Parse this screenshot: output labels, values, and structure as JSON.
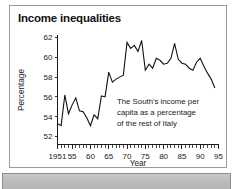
{
  "figure": {
    "title": "Income inequalities",
    "background_color": "#ffffff",
    "frame_color": "#9a9a9a",
    "line_color": "#111111",
    "bottom_band_color": "#c1c1c1"
  },
  "annotation": {
    "line1": "The South's income per",
    "line2": "capita as a percentage",
    "line3": "of the rest of Italy"
  },
  "chart_data": {
    "type": "line",
    "title": "Income inequalities",
    "xlabel": "Year",
    "ylabel": "Percentage",
    "xlim": [
      1951,
      1995
    ],
    "ylim": [
      51.2,
      62.3
    ],
    "ytick_values": [
      52,
      54,
      56,
      58,
      60,
      62
    ],
    "ytick_labels": [
      "52",
      "54",
      "56",
      "58",
      "60",
      "62"
    ],
    "xtick_values": [
      1951,
      1955,
      1960,
      1965,
      1970,
      1975,
      1980,
      1985,
      1990,
      1995
    ],
    "xtick_labels": [
      "1951",
      "55",
      "60",
      "65",
      "70",
      "75",
      "80",
      "85",
      "90",
      "95"
    ],
    "minor_xticks_every": 1,
    "grid": false,
    "legend": null,
    "annotation_text": "The South's income per capita as a percentage of the rest of Italy",
    "series": [
      {
        "name": "South's income per capita as % of rest of Italy",
        "color": "#111111",
        "x": [
          1951,
          1952,
          1953,
          1954,
          1955,
          1956,
          1957,
          1958,
          1959,
          1960,
          1961,
          1962,
          1963,
          1964,
          1965,
          1966,
          1967,
          1968,
          1969,
          1970,
          1971,
          1972,
          1973,
          1974,
          1975,
          1976,
          1977,
          1978,
          1979,
          1980,
          1981,
          1982,
          1983,
          1984,
          1985,
          1986,
          1987,
          1988,
          1989,
          1990,
          1991,
          1992,
          1993,
          1994
        ],
        "values": [
          53.3,
          53.1,
          56.2,
          54.3,
          55.2,
          55.9,
          54.6,
          54.5,
          53.9,
          53.1,
          54.2,
          53.8,
          56.1,
          56.0,
          58.5,
          57.5,
          57.8,
          58.0,
          58.2,
          61.5,
          60.9,
          61.2,
          60.6,
          61.7,
          58.7,
          59.3,
          58.9,
          59.9,
          59.7,
          59.3,
          59.4,
          59.9,
          61.4,
          59.8,
          59.4,
          59.3,
          58.9,
          58.7,
          59.5,
          59.9,
          59.1,
          58.4,
          57.8,
          56.9
        ]
      }
    ]
  }
}
